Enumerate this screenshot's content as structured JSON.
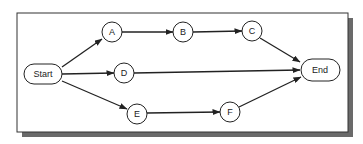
{
  "diagram": {
    "type": "network-flow",
    "nodes": [
      {
        "id": "start",
        "label": "Start",
        "shape": "rounded-rect",
        "x": 43,
        "y": 74
      },
      {
        "id": "a",
        "label": "A",
        "shape": "circle",
        "x": 112,
        "y": 32
      },
      {
        "id": "b",
        "label": "B",
        "shape": "circle",
        "x": 183,
        "y": 32
      },
      {
        "id": "c",
        "label": "C",
        "shape": "circle",
        "x": 252,
        "y": 31
      },
      {
        "id": "d",
        "label": "D",
        "shape": "circle",
        "x": 124,
        "y": 73
      },
      {
        "id": "e",
        "label": "E",
        "shape": "circle",
        "x": 137,
        "y": 114
      },
      {
        "id": "f",
        "label": "F",
        "shape": "circle",
        "x": 230,
        "y": 112
      },
      {
        "id": "end",
        "label": "End",
        "shape": "rounded-rect",
        "x": 320,
        "y": 70
      }
    ],
    "edges": [
      {
        "from": "start",
        "to": "a"
      },
      {
        "from": "a",
        "to": "b"
      },
      {
        "from": "b",
        "to": "c"
      },
      {
        "from": "c",
        "to": "end"
      },
      {
        "from": "start",
        "to": "d"
      },
      {
        "from": "d",
        "to": "end"
      },
      {
        "from": "start",
        "to": "e"
      },
      {
        "from": "e",
        "to": "f"
      },
      {
        "from": "f",
        "to": "end"
      }
    ]
  }
}
